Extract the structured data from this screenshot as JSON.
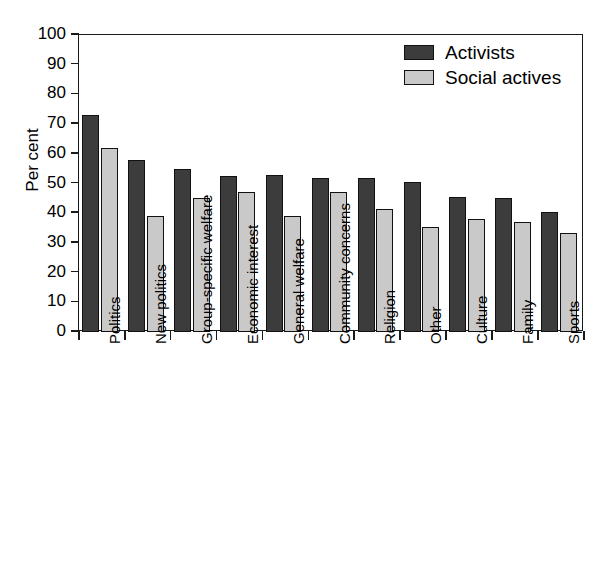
{
  "chart_data": {
    "type": "bar",
    "title": "",
    "xlabel": "",
    "ylabel": "Per cent",
    "ylim": [
      0,
      100
    ],
    "ytick_step": 10,
    "ytick_labels": [
      "100",
      "90",
      "80",
      "70",
      "60",
      "50",
      "40",
      "30",
      "20",
      "10",
      "0"
    ],
    "ytick_values": [
      100,
      90,
      80,
      70,
      60,
      50,
      40,
      30,
      20,
      10,
      0
    ],
    "grid": false,
    "legend_position": "top-right",
    "categories": [
      "Politics",
      "New politics",
      "Group-specific welfare",
      "Economic interest",
      "General welfare",
      "Community concerns",
      "Religion",
      "Other",
      "Culture",
      "Family",
      "Sports"
    ],
    "series": [
      {
        "name": "Activists",
        "color": "#3c3c3c",
        "values": [
          73,
          58,
          55,
          52.5,
          53,
          52,
          52,
          50.5,
          45.5,
          45,
          40.5
        ]
      },
      {
        "name": "Social actives",
        "color": "#c9c9c9",
        "values": [
          62,
          39,
          45,
          47,
          39,
          47,
          41.5,
          35.5,
          38,
          37,
          33.5
        ]
      }
    ]
  },
  "legend": {
    "items": [
      {
        "label": "Activists",
        "color": "#3c3c3c"
      },
      {
        "label": "Social actives",
        "color": "#c9c9c9"
      }
    ]
  },
  "axis": {
    "y_title": "Per cent"
  }
}
